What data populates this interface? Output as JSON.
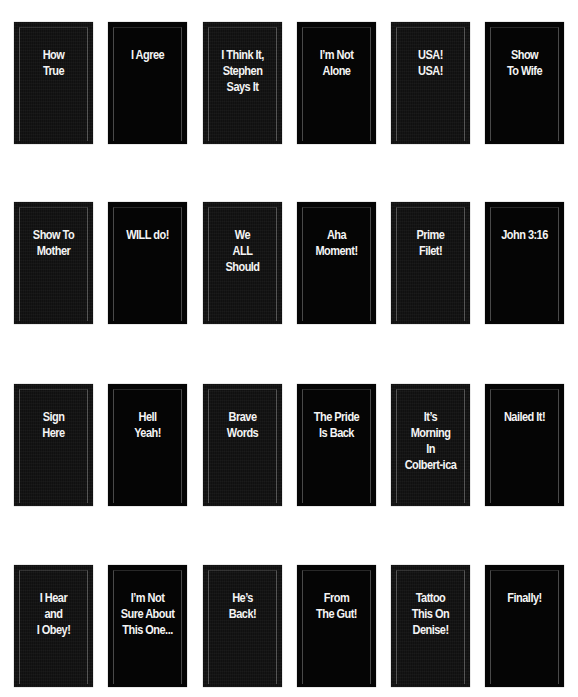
{
  "cards": [
    {
      "row": 0,
      "col": 0,
      "label": "How\nTrue",
      "style": "textured"
    },
    {
      "row": 0,
      "col": 1,
      "label": "I Agree",
      "style": "solid"
    },
    {
      "row": 0,
      "col": 2,
      "label": "I Think It,\nStephen\nSays It",
      "style": "textured"
    },
    {
      "row": 0,
      "col": 3,
      "label": "I’m Not\nAlone",
      "style": "solid"
    },
    {
      "row": 0,
      "col": 4,
      "label": "USA!\nUSA!",
      "style": "textured"
    },
    {
      "row": 0,
      "col": 5,
      "label": "Show\nTo Wife",
      "style": "solid"
    },
    {
      "row": 1,
      "col": 0,
      "label": "Show To\nMother",
      "style": "textured"
    },
    {
      "row": 1,
      "col": 1,
      "label": "WILL do!",
      "style": "solid"
    },
    {
      "row": 1,
      "col": 2,
      "label": "We\nALL\nShould",
      "style": "textured"
    },
    {
      "row": 1,
      "col": 3,
      "label": "Aha\nMoment!",
      "style": "solid"
    },
    {
      "row": 1,
      "col": 4,
      "label": "Prime\nFilet!",
      "style": "textured"
    },
    {
      "row": 1,
      "col": 5,
      "label": "John 3:16",
      "style": "solid"
    },
    {
      "row": 2,
      "col": 0,
      "label": "Sign\nHere",
      "style": "textured"
    },
    {
      "row": 2,
      "col": 1,
      "label": "Hell\nYeah!",
      "style": "solid"
    },
    {
      "row": 2,
      "col": 2,
      "label": "Brave\nWords",
      "style": "textured"
    },
    {
      "row": 2,
      "col": 3,
      "label": "The Pride\nIs Back",
      "style": "solid"
    },
    {
      "row": 2,
      "col": 4,
      "label": "It’s\nMorning\nIn\nColbert-ica",
      "style": "textured"
    },
    {
      "row": 2,
      "col": 5,
      "label": "Nailed It!",
      "style": "solid"
    },
    {
      "row": 3,
      "col": 0,
      "label": "I Hear\nand\nI Obey!",
      "style": "textured"
    },
    {
      "row": 3,
      "col": 1,
      "label": "I’m Not\nSure About\nThis One...",
      "style": "solid"
    },
    {
      "row": 3,
      "col": 2,
      "label": "He’s\nBack!",
      "style": "textured"
    },
    {
      "row": 3,
      "col": 3,
      "label": "From\nThe Gut!",
      "style": "solid"
    },
    {
      "row": 3,
      "col": 4,
      "label": "Tattoo\nThis On\nDenise!",
      "style": "textured"
    },
    {
      "row": 3,
      "col": 5,
      "label": "Finally!",
      "style": "solid"
    }
  ],
  "layout": {
    "col_x": [
      14,
      108,
      203,
      297,
      391,
      485
    ],
    "row_y": [
      22,
      202,
      384,
      565
    ]
  },
  "colors": {
    "page_background": "#ffffff",
    "card_solid": "#050505",
    "card_textured": "#151515",
    "caption_text": "#f4f4f4"
  }
}
